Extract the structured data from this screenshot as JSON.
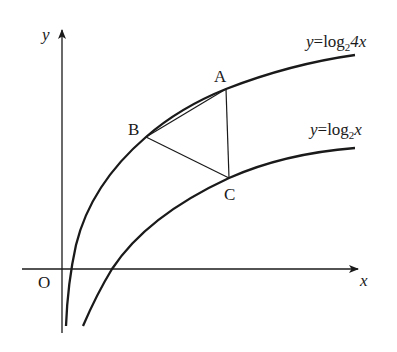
{
  "figure": {
    "type": "function-graph-diagram",
    "axes": {
      "x_label": "x",
      "y_label": "y",
      "origin_label": "O"
    },
    "curves": [
      {
        "id": "upper",
        "label_prefix": "y=log",
        "label_sub": "2",
        "label_suffix": "4x",
        "equation": "y=log_2 4x"
      },
      {
        "id": "lower",
        "label_prefix": "y=log",
        "label_sub": "2",
        "label_suffix": "x",
        "equation": "y=log_2 x"
      }
    ],
    "points": [
      {
        "name": "A",
        "on_curve": "y=log_2 4x"
      },
      {
        "name": "B",
        "on_curve": "y=log_2 4x"
      },
      {
        "name": "C",
        "on_curve": "y=log_2 x"
      }
    ],
    "segments": [
      "AB",
      "BC",
      "CA"
    ],
    "colors": {
      "stroke": "#1a1a1a",
      "background": "#ffffff"
    }
  }
}
